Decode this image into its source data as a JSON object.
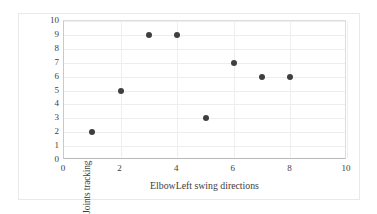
{
  "chart_data": {
    "type": "scatter",
    "title": "",
    "xlabel": "ElbowLeft swing directions",
    "ylabel": "Joints tracking status amount",
    "xlim": [
      0,
      10
    ],
    "ylim": [
      0,
      10
    ],
    "x_ticks": [
      "0",
      "2",
      "4",
      "6",
      "8",
      "10"
    ],
    "y_ticks": [
      "10",
      "9",
      "8",
      "7",
      "6",
      "5",
      "4",
      "3",
      "2",
      "1",
      "0"
    ],
    "x_tick_values": [
      0,
      2,
      4,
      6,
      8,
      10
    ],
    "y_tick_values": [
      10,
      9,
      8,
      7,
      6,
      5,
      4,
      3,
      2,
      1,
      0
    ],
    "grid": "horizontal-and-vertical",
    "legend": "none",
    "marker_color": "#3f3f3f",
    "marker_shape": "circle",
    "points": [
      {
        "x": 1,
        "y": 2
      },
      {
        "x": 2,
        "y": 5
      },
      {
        "x": 3,
        "y": 9
      },
      {
        "x": 4,
        "y": 9
      },
      {
        "x": 5,
        "y": 3
      },
      {
        "x": 6,
        "y": 7
      },
      {
        "x": 7,
        "y": 6
      },
      {
        "x": 8,
        "y": 6
      }
    ],
    "x": [
      1,
      2,
      3,
      4,
      5,
      6,
      7,
      8
    ],
    "values": [
      2,
      5,
      9,
      9,
      3,
      7,
      6,
      6
    ]
  },
  "colors": {
    "marker": "#3f3f3f",
    "gridline": "#ededed",
    "axis": "#b9b9b9",
    "text": "#3d3d3d",
    "background": "#ffffff"
  }
}
